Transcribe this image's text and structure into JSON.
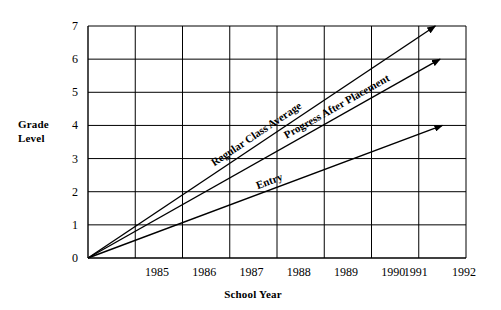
{
  "chart_data": {
    "type": "line",
    "title": "",
    "xlabel": "School Year",
    "ylabel_line1": "Grade",
    "ylabel_line2": "Level",
    "x_ticks": [
      "1985",
      "1986",
      "1987",
      "1988",
      "1989",
      "1990",
      "1991",
      "1992"
    ],
    "y_ticks": [
      "0",
      "1",
      "2",
      "3",
      "4",
      "5",
      "6",
      "7"
    ],
    "xlim": [
      1984,
      1992
    ],
    "ylim": [
      0,
      7
    ],
    "grid": "horizontal-and-vertical",
    "legend": "inline-labels",
    "series": [
      {
        "name": "Regular Class Average",
        "label": "Regular Class Average",
        "x": [
          1984,
          1991.35
        ],
        "y": [
          0,
          7.0
        ],
        "arrow": true
      },
      {
        "name": "Progress After Placement",
        "label": "Progress After Placement",
        "x": [
          1984,
          1991.45
        ],
        "y": [
          0,
          6.0
        ],
        "arrow": true
      },
      {
        "name": "Entry",
        "label": "Entry",
        "x": [
          1984,
          1991.5
        ],
        "y": [
          0,
          4.0
        ],
        "arrow": true
      }
    ]
  }
}
